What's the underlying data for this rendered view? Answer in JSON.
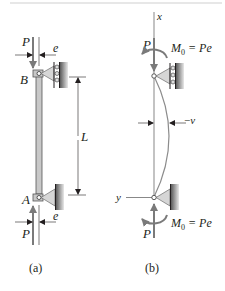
{
  "diagram": {
    "top_rule_color": "#cfcfcf",
    "figure_a": {
      "caption": "(a)",
      "load_top": "P",
      "load_bottom": "P",
      "eccentricity_top": "e",
      "eccentricity_bottom": "e",
      "point_top": "B",
      "point_bottom": "A",
      "length": "L",
      "top_support": "roller support",
      "bottom_support": "pin support"
    },
    "figure_b": {
      "caption": "(b)",
      "axis_x": "x",
      "axis_y": "y",
      "load_top": "P",
      "load_bottom": "P",
      "moment_top_main": "M",
      "moment_top_sub": "0",
      "moment_top_rest": " = Pe",
      "moment_bottom_main": "M",
      "moment_bottom_sub": "0",
      "moment_bottom_rest": " = Pe",
      "deflection": "v",
      "deflection_sign": "−"
    },
    "colors": {
      "ink": "#231f20",
      "column_fill": "#c8c8c8",
      "support_fill": "#d6d6d6",
      "wall_fill": "#9a9a9a",
      "arrow_gray": "#7a7a7a",
      "curve": "#8c8c8c"
    }
  }
}
